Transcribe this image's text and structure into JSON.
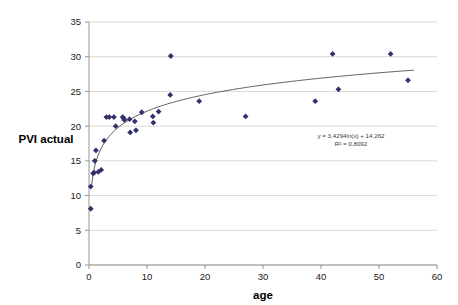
{
  "chart_data": {
    "type": "scatter",
    "title": "",
    "xlabel": "age",
    "ylabel": "PVI actual",
    "xlim": [
      0,
      60
    ],
    "ylim": [
      0,
      35
    ],
    "x_ticks": [
      0,
      10,
      20,
      30,
      40,
      50,
      60
    ],
    "y_ticks": [
      0,
      5,
      10,
      15,
      20,
      25,
      30,
      35
    ],
    "grid": "horizontal",
    "legend": "none",
    "marker_shape": "diamond",
    "marker_color": "#31316b",
    "trendline_color": "#4a4a4a",
    "annotations": [
      "y = 3,4294ln(x) + 14,262",
      "R² = 0,8092"
    ],
    "trendline": {
      "type": "logarithmic",
      "slope": 3.4294,
      "intercept": 14.262,
      "r_squared": 0.8092,
      "equation": "y = 3,4294ln(x) + 14,262",
      "r2_label": "R² = 0,8092",
      "x_start": 0.45,
      "x_end": 56.0
    },
    "points": [
      {
        "x": 0.3,
        "y": 8.1
      },
      {
        "x": 0.3,
        "y": 11.3
      },
      {
        "x": 0.7,
        "y": 13.2
      },
      {
        "x": 0.9,
        "y": 13.3
      },
      {
        "x": 1.0,
        "y": 15.0
      },
      {
        "x": 1.2,
        "y": 16.5
      },
      {
        "x": 1.6,
        "y": 13.4
      },
      {
        "x": 2.1,
        "y": 13.7
      },
      {
        "x": 2.6,
        "y": 17.9
      },
      {
        "x": 3.0,
        "y": 21.3
      },
      {
        "x": 3.5,
        "y": 21.3
      },
      {
        "x": 4.3,
        "y": 21.3
      },
      {
        "x": 4.6,
        "y": 20.0
      },
      {
        "x": 5.8,
        "y": 21.3
      },
      {
        "x": 6.0,
        "y": 21.1
      },
      {
        "x": 6.1,
        "y": 20.9
      },
      {
        "x": 7.0,
        "y": 21.0
      },
      {
        "x": 7.1,
        "y": 19.1
      },
      {
        "x": 7.9,
        "y": 20.7
      },
      {
        "x": 8.1,
        "y": 19.4
      },
      {
        "x": 9.1,
        "y": 22.0
      },
      {
        "x": 11.0,
        "y": 21.4
      },
      {
        "x": 11.1,
        "y": 20.5
      },
      {
        "x": 12.0,
        "y": 22.1
      },
      {
        "x": 14.0,
        "y": 24.5
      },
      {
        "x": 14.1,
        "y": 30.1
      },
      {
        "x": 19.0,
        "y": 23.6
      },
      {
        "x": 27.0,
        "y": 21.4
      },
      {
        "x": 39.0,
        "y": 23.6
      },
      {
        "x": 42.0,
        "y": 30.4
      },
      {
        "x": 43.0,
        "y": 25.3
      },
      {
        "x": 52.0,
        "y": 30.4
      },
      {
        "x": 55.0,
        "y": 26.6
      }
    ]
  }
}
